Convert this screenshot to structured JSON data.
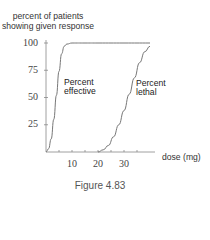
{
  "chart_data": {
    "type": "line",
    "title": "",
    "ylabel": "percent of patients showing given response",
    "ylabel_lines": [
      "percent of patients",
      "showing given response"
    ],
    "xlabel": "dose (mg)",
    "caption": "Figure 4.83",
    "xlim": [
      0,
      40
    ],
    "ylim": [
      0,
      100
    ],
    "xticks": [
      10,
      20,
      30
    ],
    "yticks": [
      25,
      50,
      75,
      100
    ],
    "grid": false,
    "legend": "none (inline curve labels)",
    "series": [
      {
        "name": "Percent effective",
        "label_lines": [
          "Percent",
          "effective"
        ],
        "x": [
          0,
          1,
          2,
          3,
          4,
          5,
          6,
          7,
          8,
          10,
          15,
          20,
          30,
          40
        ],
        "y": [
          0,
          3,
          12,
          30,
          52,
          74,
          90,
          97,
          99,
          100,
          100,
          100,
          100,
          100
        ]
      },
      {
        "name": "Percent lethal",
        "label_lines": [
          "Percent",
          "lethal"
        ],
        "x": [
          20,
          22,
          24,
          26,
          28,
          30,
          32,
          34,
          36,
          38,
          40
        ],
        "y": [
          0,
          2,
          6,
          14,
          25,
          38,
          53,
          68,
          82,
          92,
          97
        ]
      }
    ]
  }
}
